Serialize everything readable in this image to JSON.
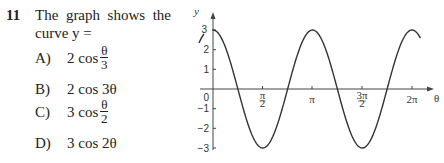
{
  "question": {
    "number": "11",
    "stem_line1": [
      "The",
      "graph",
      "shows",
      "the"
    ],
    "stem_line2": "curve y =",
    "options": [
      {
        "label": "A)",
        "coef": "2",
        "func": "cos",
        "arg_num": "θ",
        "arg_den": "3",
        "arg": ""
      },
      {
        "label": "B)",
        "coef": "2",
        "func": "cos",
        "arg": "3θ"
      },
      {
        "label": "C)",
        "coef": "3",
        "func": "cos",
        "arg_num": "θ",
        "arg_den": "2",
        "arg": ""
      },
      {
        "label": "D)",
        "coef": "3",
        "func": "cos",
        "arg": "2θ"
      }
    ]
  },
  "chart_data": {
    "type": "line",
    "title": "",
    "xlabel": "θ",
    "ylabel": "y",
    "x_tick_labels": [
      "π/2",
      "π",
      "3π/2",
      "2π"
    ],
    "x_tick_values": [
      1.5708,
      3.1416,
      4.7124,
      6.2832
    ],
    "y_tick_labels": [
      "3",
      "2",
      "1",
      "0",
      "−1",
      "−2",
      "−3"
    ],
    "y_tick_values": [
      3,
      2,
      1,
      0,
      -1,
      -2,
      -3
    ],
    "ylim": [
      -3,
      3
    ],
    "xlim": [
      -0.4,
      6.6
    ],
    "grid": false,
    "legend": "none",
    "series": [
      {
        "name": "y = 3cos2θ",
        "x": [
          0,
          0.3927,
          0.7854,
          1.1781,
          1.5708,
          1.9635,
          2.3562,
          2.7489,
          3.1416,
          3.5343,
          3.927,
          4.3197,
          4.7124,
          5.1051,
          5.4978,
          5.8905,
          6.2832
        ],
        "values": [
          3,
          2.12,
          0,
          -2.12,
          -3,
          -2.12,
          0,
          2.12,
          3,
          2.12,
          0,
          -2.12,
          -3,
          -2.12,
          0,
          2.12,
          3
        ]
      }
    ],
    "annotations": [
      {
        "text": "3",
        "at": "y-axis top"
      },
      {
        "text": "0",
        "at": "origin"
      }
    ]
  }
}
